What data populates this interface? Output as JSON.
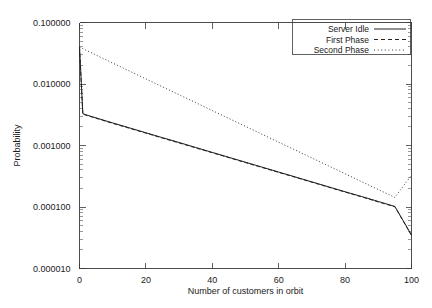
{
  "chart_data": {
    "type": "line",
    "title": "",
    "xlabel": "Number of customers in orbit",
    "ylabel": "Probability",
    "xlim": [
      0,
      100
    ],
    "ylim": [
      1e-05,
      0.1
    ],
    "yscale": "log",
    "grid": false,
    "legend_position": "top-right",
    "xticks": [
      0,
      20,
      40,
      60,
      80,
      100
    ],
    "xtick_labels": [
      "0",
      "20",
      "40",
      "60",
      "80",
      "100"
    ],
    "yticks": [
      0.1,
      0.01,
      0.001,
      0.0001,
      1e-05
    ],
    "ytick_labels": [
      "0.100000",
      "0.010000",
      "0.001000",
      "0.000100",
      "0.000010"
    ],
    "x": [
      0,
      1,
      2,
      4,
      6,
      8,
      10,
      15,
      20,
      25,
      30,
      35,
      40,
      45,
      50,
      55,
      60,
      65,
      70,
      75,
      80,
      85,
      90,
      95,
      100
    ],
    "series": [
      {
        "name": "Server Idle",
        "style": "solid",
        "values": [
          0.04,
          0.0033,
          0.00315,
          0.00292,
          0.00271,
          0.00251,
          0.00233,
          0.00194,
          0.00161,
          0.00134,
          0.00112,
          0.000929,
          0.000773,
          0.000643,
          0.000535,
          0.000445,
          0.00037,
          0.000308,
          0.000256,
          0.000213,
          0.000177,
          0.000148,
          0.000123,
          0.000102,
          3.5e-05
        ]
      },
      {
        "name": "First Phase",
        "style": "dashed",
        "values": [
          0.04,
          0.00325,
          0.0031,
          0.00288,
          0.00267,
          0.00247,
          0.00229,
          0.00191,
          0.00159,
          0.00132,
          0.0011,
          0.000915,
          0.000762,
          0.000634,
          0.000527,
          0.000439,
          0.000365,
          0.000304,
          0.000253,
          0.00021,
          0.000175,
          0.000146,
          0.000121,
          0.000101,
          3.45e-05
        ]
      },
      {
        "name": "Second Phase",
        "style": "dotted",
        "values": [
          0.04,
          0.0376,
          0.0354,
          0.0314,
          0.0278,
          0.0247,
          0.0219,
          0.0163,
          0.0121,
          0.00899,
          0.00669,
          0.00498,
          0.0037,
          0.00275,
          0.00205,
          0.00152,
          0.00113,
          0.000843,
          0.000627,
          0.000467,
          0.000347,
          0.000258,
          0.000192,
          0.000143,
          0.00033
        ]
      }
    ]
  },
  "legend": {
    "entries": [
      {
        "label": "Server Idle",
        "style": "solid"
      },
      {
        "label": "First Phase",
        "style": "dashed"
      },
      {
        "label": "Second Phase",
        "style": "dotted"
      }
    ]
  }
}
